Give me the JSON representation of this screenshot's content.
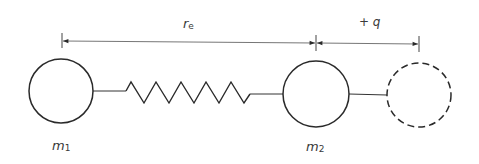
{
  "diagram": {
    "labels": {
      "equilibrium_distance": {
        "symbol": "r",
        "subscript": "e"
      },
      "displacement": "+ q",
      "mass1": {
        "symbol": "m",
        "subscript": "1"
      },
      "mass2": {
        "symbol": "m",
        "subscript": "2"
      }
    },
    "elements": {
      "mass1_circle": "solid",
      "spring": "zigzag",
      "mass2_circle": "solid",
      "displaced_mass_circle": "dashed"
    },
    "colors": {
      "stroke": "#2a2a2a",
      "dimension_line": "#555555",
      "text": "#3a3a3a",
      "background": "#ffffff"
    }
  }
}
